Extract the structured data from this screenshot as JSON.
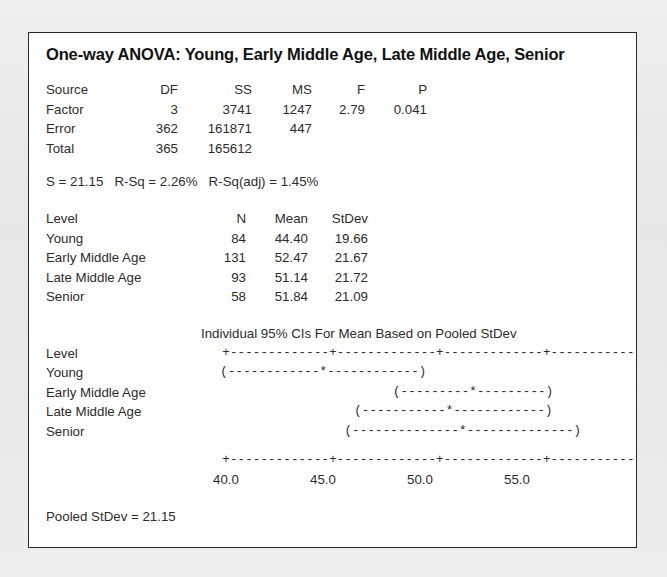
{
  "document": {
    "title": "One-way ANOVA: Young, Early Middle Age, Late Middle Age, Senior",
    "kind": "minitab-one-way-anova-output"
  },
  "anova_table": {
    "headers": [
      "Source",
      "DF",
      "SS",
      "MS",
      "F",
      "P"
    ],
    "rows": [
      {
        "source": "Factor",
        "df": "3",
        "ss": "3741",
        "ms": "1247",
        "f": "2.79",
        "p": "0.041"
      },
      {
        "source": "Error",
        "df": "362",
        "ss": "161871",
        "ms": "447",
        "f": "",
        "p": ""
      },
      {
        "source": "Total",
        "df": "365",
        "ss": "165612",
        "ms": "",
        "f": "",
        "p": ""
      }
    ]
  },
  "model_summary": {
    "line": "S = 21.15   R-Sq = 2.26%   R-Sq(adj) = 1.45%",
    "s": "21.15",
    "r_sq": "2.26%",
    "r_sq_adj": "1.45%"
  },
  "level_table": {
    "headers": [
      "Level",
      "N",
      "Mean",
      "StDev"
    ],
    "rows": [
      {
        "level": "Young",
        "n": "84",
        "mean": "44.40",
        "stdev": "19.66"
      },
      {
        "level": "Early Middle Age",
        "n": "131",
        "mean": "52.47",
        "stdev": "21.67"
      },
      {
        "level": "Late Middle Age",
        "n": "93",
        "mean": "51.14",
        "stdev": "21.72"
      },
      {
        "level": "Senior",
        "n": "58",
        "mean": "51.84",
        "stdev": "21.09"
      }
    ]
  },
  "ci_plot": {
    "header": "Individual 95% CIs For Mean Based on Pooled StDev",
    "level_column_header": "Level",
    "axis_art_top": "+-------------+-------------+-------------+-------------",
    "axis_art_bottom": "+-------------+-------------+-------------+-------------",
    "tick_labels": [
      "40.0",
      "45.0",
      "50.0",
      "55.0"
    ],
    "tick_values": [
      40.0,
      45.0,
      50.0,
      55.0
    ],
    "rows": [
      {
        "level": "Young",
        "art": "(------------*------------)",
        "lower": 39.9,
        "mean": 44.4,
        "upper": 48.9
      },
      {
        "level": "Early Middle Age",
        "art": "(---------*---------)",
        "lower": 48.8,
        "mean": 52.47,
        "upper": 56.1
      },
      {
        "level": "Late Middle Age",
        "art": "(-----------*------------)",
        "lower": 46.8,
        "mean": 51.14,
        "upper": 55.5
      },
      {
        "level": "Senior",
        "art": "(--------------*--------------)",
        "lower": 46.3,
        "mean": 51.84,
        "upper": 57.4
      }
    ]
  },
  "footer": {
    "pooled_stdev_line": "Pooled StDev = 21.15",
    "pooled_stdev": "21.15"
  },
  "chart_data": {
    "type": "scatter",
    "title": "Individual 95% CIs For Mean Based on Pooled StDev",
    "xlabel": "",
    "ylabel": "",
    "xlim": [
      38.0,
      58.5
    ],
    "grid": false,
    "legend": "none",
    "xticks": [
      40.0,
      45.0,
      50.0,
      55.0
    ],
    "xticklabels": [
      "40.0",
      "45.0",
      "50.0",
      "55.0"
    ],
    "categories": [
      "Young",
      "Early Middle Age",
      "Late Middle Age",
      "Senior"
    ],
    "series": [
      {
        "name": "Mean",
        "values": [
          44.4,
          52.47,
          51.14,
          51.84
        ]
      },
      {
        "name": "CI lower",
        "values": [
          39.9,
          48.8,
          46.8,
          46.3
        ]
      },
      {
        "name": "CI upper",
        "values": [
          48.9,
          56.1,
          55.5,
          57.4
        ]
      },
      {
        "name": "N",
        "values": [
          84,
          131,
          93,
          58
        ]
      },
      {
        "name": "StDev",
        "values": [
          19.66,
          21.67,
          21.72,
          21.09
        ]
      }
    ]
  }
}
